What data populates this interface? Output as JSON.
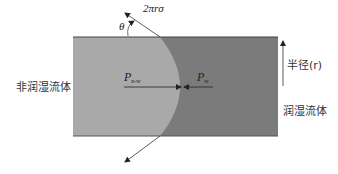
{
  "diagram": {
    "type": "capillary-pressure-meniscus",
    "labels": {
      "nonwetting_fluid": "非润湿流体",
      "wetting_fluid": "润湿流体",
      "radius": "半径(r)",
      "tension_force": "2πrσ",
      "contact_angle": "θ",
      "pressure_nonwetting": {
        "main": "P",
        "sub": "n-w"
      },
      "pressure_wetting": {
        "main": "P",
        "sub": "w"
      }
    },
    "colors": {
      "nonwetting_region": "#a9a9a9",
      "wetting_region": "#7b7b7b",
      "lines": "#333333",
      "background": "#ffffff"
    }
  }
}
